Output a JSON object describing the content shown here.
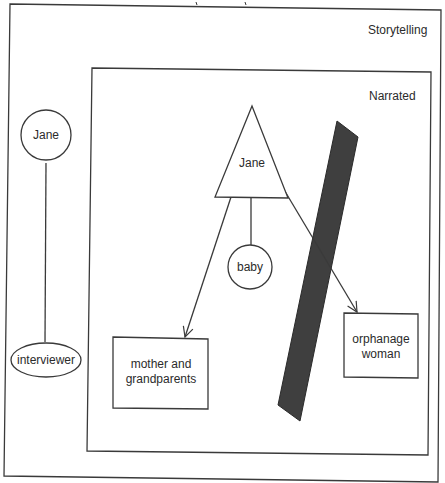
{
  "diagram": {
    "frames": {
      "outer": {
        "label": "Storytelling"
      },
      "inner": {
        "label": "Narrated"
      }
    },
    "storytelling_nodes": {
      "narrator": {
        "label": "Jane",
        "shape": "circle"
      },
      "interviewer": {
        "label": "interviewer",
        "shape": "ellipse"
      }
    },
    "narrated_nodes": {
      "protagonist": {
        "label": "Jane",
        "shape": "triangle"
      },
      "baby": {
        "label": "baby",
        "shape": "circle"
      },
      "mother": {
        "label_line1": "mother and",
        "label_line2": "grandparents",
        "shape": "rectangle"
      },
      "orphanage": {
        "label_line1": "orphanage",
        "label_line2": "woman",
        "shape": "rectangle"
      }
    },
    "barrier": {
      "color": "#3f3f3f",
      "shape": "slanted-bar"
    },
    "edges": [
      {
        "from": "Jane (narrator)",
        "to": "interviewer",
        "type": "line"
      },
      {
        "from": "Jane (triangle)",
        "to": "baby",
        "type": "line"
      },
      {
        "from": "Jane (triangle)",
        "to": "mother and grandparents",
        "type": "arrow"
      },
      {
        "from": "Jane (triangle)",
        "to": "orphanage woman",
        "type": "arrow",
        "crosses": "barrier"
      }
    ]
  }
}
